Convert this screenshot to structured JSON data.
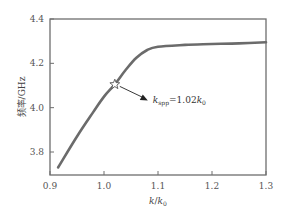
{
  "chart_data": {
    "type": "line",
    "title": "",
    "xlabel": "k/k0",
    "ylabel": "频率/GHz",
    "xlim": [
      0.9,
      1.3
    ],
    "ylim": [
      3.7,
      4.4
    ],
    "xticks": [
      "0.9",
      "1.0",
      "1.1",
      "1.2",
      "1.3"
    ],
    "yticks": [
      "3.8",
      "4.0",
      "4.2",
      "4.4"
    ],
    "grid": false,
    "legend": null,
    "series": [
      {
        "name": "dispersion",
        "color": "#6b6b6b",
        "x": [
          0.915,
          0.95,
          0.98,
          1.0,
          1.02,
          1.04,
          1.06,
          1.08,
          1.1,
          1.15,
          1.2,
          1.25,
          1.3
        ],
        "y": [
          3.73,
          3.87,
          3.98,
          4.05,
          4.105,
          4.17,
          4.225,
          4.26,
          4.275,
          4.283,
          4.287,
          4.29,
          4.295
        ]
      }
    ],
    "annotations": [
      {
        "marker": "star",
        "x": 1.02,
        "y": 4.105,
        "text_main": "k",
        "text_sub": "spp",
        "text_eq": "=1.02",
        "text_k": "k",
        "text_k_sub": "0",
        "arrow": true
      }
    ]
  },
  "labels": {
    "ylabel_cn": "频率",
    "ylabel_unit": "/GHz",
    "xlabel_k": "k",
    "xlabel_slash": "/",
    "xlabel_k0": "k",
    "xlabel_k0_sub": "0"
  }
}
